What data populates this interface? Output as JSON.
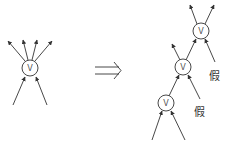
{
  "left_diagram": {
    "node": {
      "label": "V",
      "cx": 30,
      "cy": 68,
      "r": 8
    },
    "outgoing_arrow_count": 4,
    "incoming_arrow_count": 2
  },
  "implies_symbol": "⟹",
  "right_diagram": {
    "nodes": [
      {
        "label": "V",
        "cx": 201,
        "cy": 31,
        "r": 8
      },
      {
        "label": "V",
        "cx": 183,
        "cy": 67,
        "r": 8
      },
      {
        "label": "V",
        "cx": 166,
        "cy": 103,
        "r": 8
      }
    ],
    "false_labels": [
      {
        "text": "假",
        "x": 209,
        "y": 80
      },
      {
        "text": "假",
        "x": 194,
        "y": 116
      }
    ]
  },
  "colors": {
    "stroke": "#333333",
    "background": "#ffffff"
  }
}
